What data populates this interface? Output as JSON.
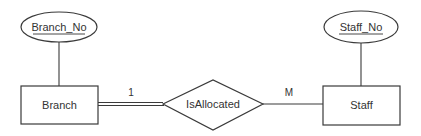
{
  "diagram": {
    "type": "er-diagram",
    "entities": [
      {
        "id": "branch",
        "label": "Branch"
      },
      {
        "id": "staff",
        "label": "Staff"
      }
    ],
    "attributes": [
      {
        "id": "branch_no",
        "label": "Branch_No",
        "entity": "branch",
        "key": true
      },
      {
        "id": "staff_no",
        "label": "Staff_No",
        "entity": "staff",
        "key": true
      }
    ],
    "relationships": [
      {
        "id": "isallocated",
        "label": "IsAllocated",
        "from": "branch",
        "to": "staff",
        "from_cardinality": "1",
        "to_cardinality": "M",
        "from_participation": "total",
        "to_participation": "partial"
      }
    ],
    "colors": {
      "stroke": "#3a3a3a",
      "text": "#333333",
      "background": "#ffffff"
    }
  }
}
